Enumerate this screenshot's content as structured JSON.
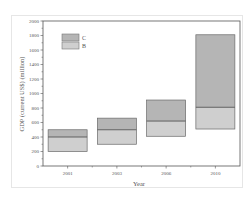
{
  "chart_data": {
    "type": "bar",
    "subtype": "floating-stacked-range",
    "title": "",
    "xlabel": "Year",
    "ylabel": "GDP (current US$) (million)",
    "categories": [
      "2001",
      "2003",
      "2006",
      "2010"
    ],
    "series": [
      {
        "name": "B",
        "color": "#cfcfcf",
        "low": [
          200,
          300,
          410,
          510
        ],
        "high": [
          400,
          500,
          620,
          810
        ]
      },
      {
        "name": "C",
        "color": "#b5b5b5",
        "low": [
          400,
          500,
          620,
          810
        ],
        "high": [
          500,
          660,
          910,
          1810
        ]
      }
    ],
    "yticks": [
      0,
      200,
      400,
      600,
      800,
      1000,
      1200,
      1400,
      1600,
      1800,
      2000
    ],
    "ylim": [
      0,
      2000
    ],
    "grid": false,
    "legend": {
      "position": "upper-left",
      "entries": [
        "C",
        "B"
      ]
    }
  },
  "axis": {
    "x_title": "Year",
    "y_title": "GDP (current US$) (million)"
  },
  "legend": {
    "c_label": "C",
    "b_label": "B"
  }
}
